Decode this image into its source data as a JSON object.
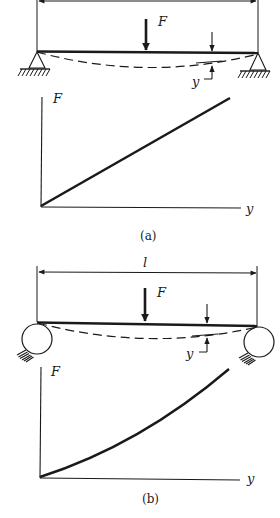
{
  "figure": {
    "panel_a": {
      "caption": "(a)",
      "support_type": "pinned (triangle) supports",
      "labels": {
        "force": "F",
        "deflection": "y",
        "graph_y_axis": "F",
        "graph_x_axis": "y"
      },
      "graph": {
        "shape": "linear",
        "description": "Force F vs deflection y is a straight line through the origin"
      }
    },
    "panel_b": {
      "caption": "(b)",
      "support_type": "roller (circle) supports",
      "labels": {
        "span": "l",
        "force": "F",
        "deflection": "y",
        "graph_y_axis": "F",
        "graph_x_axis": "y"
      },
      "graph": {
        "shape": "nonlinear (concave up)",
        "description": "Force F vs deflection y curves upward (stiffening)"
      }
    }
  },
  "colors": {
    "ink": "#1a1a1a",
    "background": "#ffffff"
  }
}
